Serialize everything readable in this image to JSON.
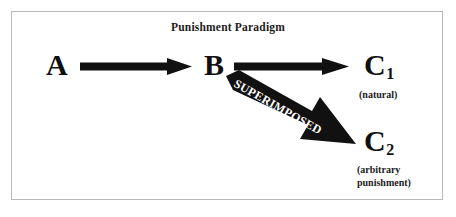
{
  "figure": {
    "title": "Punishment Paradigm",
    "frame_color": "#b9b9b9",
    "background_color": "#ffffff",
    "ink_color": "#111111"
  },
  "nodes": {
    "a": {
      "label": "A",
      "subscript": ""
    },
    "b": {
      "label": "B",
      "subscript": ""
    },
    "c1": {
      "label": "C",
      "subscript": "1",
      "caption_line1": "(natural)"
    },
    "c2": {
      "label": "C",
      "subscript": "2",
      "caption_line1": "(arbitrary",
      "caption_line2": "punishment)"
    }
  },
  "arrows": {
    "a_to_b": {
      "from": "A",
      "to": "B",
      "style": "thin-shaft-solid-head",
      "label": ""
    },
    "b_to_c1": {
      "from": "B",
      "to": "C1",
      "style": "thin-shaft-solid-head",
      "label": ""
    },
    "b_to_c2": {
      "from": "B",
      "to": "C2",
      "style": "thick-tapered-block",
      "label": "SUPERIMPOSED"
    }
  }
}
